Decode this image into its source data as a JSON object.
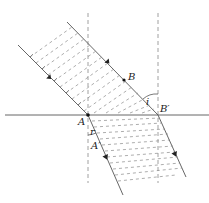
{
  "labels": {
    "A": "A",
    "B": "B",
    "B_prime": "B′",
    "A_prime": "A′",
    "angle_i": "i",
    "angle_r": "r"
  },
  "colors": {
    "line": "#555555",
    "dash": "#8a8a8a",
    "point": "#111111"
  },
  "geometry": {
    "interface_y": 115,
    "normals_x": [
      88,
      158
    ],
    "points": {
      "A": [
        88,
        115
      ],
      "B": [
        124,
        80
      ],
      "B_prime": [
        158,
        115
      ],
      "A_prime": [
        95,
        143
      ]
    }
  }
}
